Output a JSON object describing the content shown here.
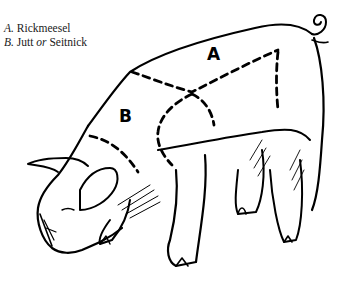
{
  "legend": {
    "items": [
      {
        "key": "A.",
        "name": "Rickmeesel"
      },
      {
        "key": "B.",
        "name_part1": "Jutt",
        "connector": "or",
        "name_part2": "Seitnick"
      }
    ]
  },
  "figure": {
    "style": "black ink line drawing",
    "regions": [
      {
        "label": "A"
      },
      {
        "label": "B"
      }
    ],
    "colors": {
      "ink": "#000000",
      "background": "#ffffff"
    }
  }
}
